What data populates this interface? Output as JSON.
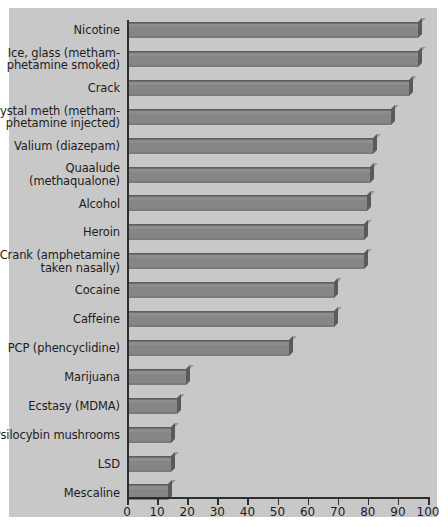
{
  "chart_data": {
    "type": "bar",
    "orientation": "horizontal",
    "title": "",
    "subtitle": "",
    "xlabel": "",
    "ylabel": "",
    "xlim": [
      0,
      100
    ],
    "xticks": [
      0,
      10,
      20,
      30,
      40,
      50,
      60,
      70,
      80,
      90,
      100
    ],
    "xtick_labels": [
      "0",
      "10",
      "20",
      "30",
      "40",
      "50",
      "60",
      "70",
      "80",
      "90",
      "100"
    ],
    "grid": false,
    "legend": null,
    "categories": [
      "Nicotine",
      "Ice, glass (methamphetamine smoked)",
      "Crack",
      "Crystal meth (methamphetamine injected)",
      "Valium (diazepam)",
      "Quaalude (methaqualone)",
      "Alcohol",
      "Heroin",
      "Crank (amphetamine taken nasally)",
      "Cocaine",
      "Caffeine",
      "PCP (phencyclidine)",
      "Marijuana",
      "Ecstasy (MDMA)",
      "Psilocybin mushrooms",
      "LSD",
      "Mescaline"
    ],
    "category_lines": [
      [
        "Nicotine"
      ],
      [
        "Ice, glass (metham-",
        "phetamine smoked)"
      ],
      [
        "Crack"
      ],
      [
        "Crystal meth (metham-",
        "phetamine injected)"
      ],
      [
        "Valium (diazepam)"
      ],
      [
        "Quaalude",
        "(methaqualone)"
      ],
      [
        "Alcohol"
      ],
      [
        "Heroin"
      ],
      [
        "Crank (amphetamine",
        "taken nasally)"
      ],
      [
        "Cocaine"
      ],
      [
        "Caffeine"
      ],
      [
        "PCP (phencyclidine)"
      ],
      [
        "Marijuana"
      ],
      [
        "Ecstasy (MDMA)"
      ],
      [
        "Psilocybin mushrooms"
      ],
      [
        "LSD"
      ],
      [
        "Mescaline"
      ]
    ],
    "values": [
      96,
      96,
      93,
      87,
      81,
      80,
      79,
      78,
      78,
      68,
      68,
      53,
      19,
      16,
      14,
      14,
      13
    ]
  },
  "colors": {
    "panel_background": "#c8c8c8",
    "bar_fill": "#868686",
    "bar_edge": "#5d5d5d",
    "axis": "#2e2e2e",
    "text": "#1d1d1d",
    "page_background": "#ffffff"
  }
}
